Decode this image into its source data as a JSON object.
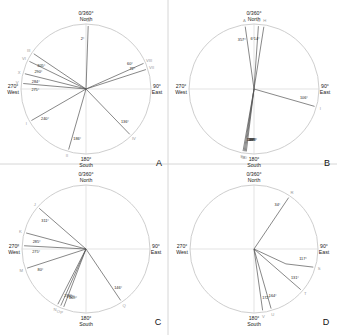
{
  "figure": {
    "colors": {
      "circle": "#c8c8c8",
      "axis": "#d0d0d0",
      "line": "#555555",
      "label": "#222222",
      "roman": "#999999",
      "divider": "#cccccc"
    },
    "cardinals": {
      "north": [
        "0/360°",
        "North"
      ],
      "east": [
        "90°",
        "East"
      ],
      "south": [
        "180°",
        "South"
      ],
      "west": [
        "270°",
        "West"
      ]
    },
    "panels": [
      {
        "id": "A",
        "cx": 86,
        "cy": 89,
        "r": 65,
        "vectors": [
          {
            "angle": 2,
            "roman": "IX",
            "label": "2°",
            "bend": null
          },
          {
            "angle": 66,
            "roman": "VIII",
            "label": "60°",
            "bend": null
          },
          {
            "angle": 72,
            "roman": "VII",
            "label": "72°",
            "bend": null
          },
          {
            "angle": 136,
            "roman": "IV",
            "label": "136°",
            "bend": null
          },
          {
            "angle": 196,
            "roman": "II",
            "label": "186°",
            "bend": null
          },
          {
            "angle": 240,
            "roman": "I",
            "label": "240°",
            "bend": null
          },
          {
            "angle": 275,
            "roman": "V",
            "label": "275°",
            "bend": null
          },
          {
            "angle": 284,
            "roman": "X",
            "label": "284°",
            "bend": null
          },
          {
            "angle": 296,
            "roman": "VI",
            "label": "290°",
            "bend": null
          },
          {
            "angle": 304,
            "roman": "III",
            "label": "305°",
            "bend": null
          }
        ]
      },
      {
        "id": "B",
        "cx": 254,
        "cy": 89,
        "r": 65,
        "vectors": [
          {
            "angle": 4,
            "roman": "C",
            "label": "6°",
            "bend": null
          },
          {
            "angle": 9,
            "roman": "H",
            "label": "14°",
            "bend": null
          },
          {
            "angle": 352,
            "roman": "A",
            "label": "357°",
            "bend": null
          },
          {
            "angle": 106,
            "roman": "I",
            "label": "106°",
            "bend": null
          },
          {
            "angle": 187,
            "roman": "D",
            "label": "186°",
            "bend": null
          },
          {
            "angle": 188,
            "roman": "F",
            "label": "188°",
            "bend": null
          },
          {
            "angle": 189,
            "roman": "G",
            "label": "187°",
            "bend": null
          },
          {
            "angle": 190,
            "roman": "E",
            "label": "189°",
            "bend": null
          }
        ]
      },
      {
        "id": "C",
        "cx": 86,
        "cy": 249,
        "r": 64,
        "vectors": [
          {
            "angle": 311,
            "roman": "J",
            "label": "311°",
            "bend": null
          },
          {
            "angle": 285,
            "roman": "K",
            "label": "285°",
            "bend": null
          },
          {
            "angle": 273,
            "roman": "L",
            "label": "275°",
            "bend": null
          },
          {
            "angle": 252,
            "roman": "M",
            "label": "80°",
            "bend": null
          },
          {
            "angle": 207,
            "roman": "N",
            "label": "210°",
            "bend": null
          },
          {
            "angle": 204,
            "roman": "O",
            "label": "212°",
            "bend": null
          },
          {
            "angle": 201,
            "roman": "P",
            "label": "209°",
            "bend": null
          },
          {
            "angle": 146,
            "roman": "Q",
            "label": "146°",
            "bend": null
          }
        ]
      },
      {
        "id": "D",
        "cx": 254,
        "cy": 249,
        "r": 64,
        "vectors": [
          {
            "angle": 34,
            "roman": "R",
            "label": "34°",
            "bend": null
          },
          {
            "angle": 107,
            "roman": "S",
            "label": "117°",
            "bend": 0.55
          },
          {
            "angle": 131,
            "roman": "T",
            "label": "131°",
            "bend": null
          },
          {
            "angle": 164,
            "roman": "U",
            "label": "164°",
            "bend": null
          },
          {
            "angle": 172,
            "roman": "V",
            "label": "172°",
            "bend": null
          }
        ]
      }
    ]
  }
}
